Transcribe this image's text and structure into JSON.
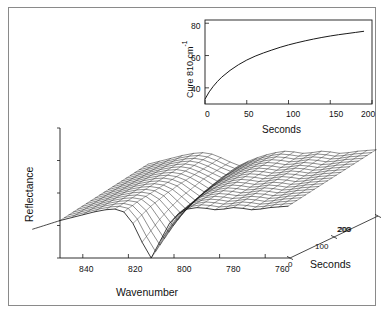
{
  "figure": {
    "title": "",
    "background_color": "#ffffff",
    "border_color": "#8a8a8a",
    "line_color": "#1a1a1a"
  },
  "main_plot": {
    "y_axis_label": "Reflectance",
    "x_axis_label": "Wavenumber",
    "depth_axis_label": "Seconds",
    "x_ticks": [
      "840",
      "820",
      "800",
      "780",
      "760"
    ],
    "depth_ticks": [
      "0",
      "100",
      "200"
    ],
    "depth_tick_overlap": "209",
    "y_tick_count": 5
  },
  "inset_plot": {
    "y_axis_label": "Cure 810 cm",
    "y_axis_label_sup": "-1",
    "x_axis_label": "Seconds",
    "y_ticks": [
      "80",
      "60",
      "40"
    ],
    "x_ticks": [
      "0",
      "50",
      "100",
      "150",
      "200"
    ]
  },
  "chart_data": [
    {
      "type": "line",
      "name": "inset-cure-kinetics",
      "title": "",
      "xlabel": "Seconds",
      "ylabel": "Cure 810 cm-1",
      "xlim": [
        0,
        200
      ],
      "ylim": [
        30,
        82
      ],
      "xticks": [
        0,
        50,
        100,
        150,
        200
      ],
      "yticks": [
        40,
        60,
        80
      ],
      "grid": false,
      "legend": "none",
      "x": [
        0,
        5,
        10,
        15,
        20,
        30,
        40,
        50,
        60,
        70,
        80,
        90,
        100,
        110,
        120,
        130,
        140,
        150,
        160,
        170,
        180,
        190
      ],
      "y": [
        33.0,
        37.5,
        41.0,
        44.0,
        46.6,
        50.8,
        54.3,
        57.2,
        59.6,
        61.6,
        63.4,
        65.1,
        66.6,
        67.9,
        69.1,
        70.2,
        71.2,
        72.1,
        72.9,
        73.6,
        74.3,
        75.0
      ]
    },
    {
      "type": "line",
      "name": "main-waterfall-surface",
      "title": "",
      "xlabel": "Wavenumber",
      "ylabel": "Reflectance",
      "zlabel": "Seconds",
      "xlim": [
        850,
        750
      ],
      "zlim": [
        0,
        200
      ],
      "grid": false,
      "legend": "none",
      "description": "3D waterfall mesh of reflectance spectra stacked over time; deep absorption valley near 810 cm-1 that fills in as cure proceeds",
      "trace_count": 21,
      "x": [
        850,
        845,
        840,
        835,
        830,
        826,
        822,
        818,
        814,
        810,
        806,
        802,
        798,
        794,
        790,
        786,
        782,
        778,
        774,
        770,
        766,
        762,
        758,
        754,
        750
      ],
      "series": [
        {
          "name": "t=0",
          "t": 0,
          "values": [
            0.52,
            0.56,
            0.6,
            0.64,
            0.67,
            0.68,
            0.64,
            0.48,
            0.22,
            0.0,
            0.24,
            0.48,
            0.62,
            0.68,
            0.7,
            0.69,
            0.67,
            0.68,
            0.7,
            0.69,
            0.67,
            0.68,
            0.7,
            0.71,
            0.72
          ]
        },
        {
          "name": "t=10",
          "t": 10,
          "values": [
            0.53,
            0.57,
            0.61,
            0.65,
            0.68,
            0.69,
            0.66,
            0.51,
            0.27,
            0.06,
            0.29,
            0.51,
            0.64,
            0.69,
            0.71,
            0.7,
            0.68,
            0.69,
            0.71,
            0.7,
            0.68,
            0.69,
            0.71,
            0.72,
            0.73
          ]
        },
        {
          "name": "t=20",
          "t": 20,
          "values": [
            0.54,
            0.58,
            0.62,
            0.66,
            0.69,
            0.7,
            0.67,
            0.54,
            0.32,
            0.12,
            0.34,
            0.54,
            0.65,
            0.7,
            0.72,
            0.71,
            0.69,
            0.7,
            0.72,
            0.71,
            0.69,
            0.7,
            0.72,
            0.73,
            0.74
          ]
        },
        {
          "name": "t=30",
          "t": 30,
          "values": [
            0.55,
            0.59,
            0.63,
            0.67,
            0.7,
            0.71,
            0.69,
            0.57,
            0.37,
            0.18,
            0.39,
            0.57,
            0.67,
            0.71,
            0.73,
            0.72,
            0.7,
            0.71,
            0.73,
            0.72,
            0.7,
            0.71,
            0.73,
            0.74,
            0.75
          ]
        },
        {
          "name": "t=40",
          "t": 40,
          "values": [
            0.56,
            0.6,
            0.64,
            0.68,
            0.71,
            0.72,
            0.7,
            0.6,
            0.42,
            0.24,
            0.43,
            0.6,
            0.68,
            0.72,
            0.74,
            0.73,
            0.71,
            0.72,
            0.74,
            0.73,
            0.71,
            0.72,
            0.74,
            0.75,
            0.76
          ]
        },
        {
          "name": "t=50",
          "t": 50,
          "values": [
            0.57,
            0.61,
            0.65,
            0.69,
            0.72,
            0.73,
            0.71,
            0.62,
            0.46,
            0.3,
            0.47,
            0.62,
            0.7,
            0.73,
            0.75,
            0.74,
            0.72,
            0.73,
            0.75,
            0.74,
            0.72,
            0.73,
            0.75,
            0.76,
            0.77
          ]
        },
        {
          "name": "t=60",
          "t": 60,
          "values": [
            0.58,
            0.62,
            0.66,
            0.7,
            0.73,
            0.74,
            0.72,
            0.64,
            0.5,
            0.35,
            0.51,
            0.64,
            0.71,
            0.74,
            0.76,
            0.75,
            0.73,
            0.74,
            0.76,
            0.75,
            0.73,
            0.74,
            0.76,
            0.77,
            0.78
          ]
        },
        {
          "name": "t=70",
          "t": 70,
          "values": [
            0.59,
            0.63,
            0.67,
            0.71,
            0.74,
            0.75,
            0.73,
            0.66,
            0.53,
            0.4,
            0.54,
            0.66,
            0.72,
            0.75,
            0.77,
            0.76,
            0.74,
            0.75,
            0.77,
            0.76,
            0.74,
            0.75,
            0.77,
            0.78,
            0.79
          ]
        },
        {
          "name": "t=80",
          "t": 80,
          "values": [
            0.6,
            0.64,
            0.68,
            0.72,
            0.75,
            0.76,
            0.74,
            0.68,
            0.56,
            0.44,
            0.57,
            0.68,
            0.73,
            0.76,
            0.78,
            0.77,
            0.75,
            0.76,
            0.78,
            0.77,
            0.75,
            0.76,
            0.78,
            0.79,
            0.8
          ]
        },
        {
          "name": "t=90",
          "t": 90,
          "values": [
            0.61,
            0.65,
            0.69,
            0.73,
            0.76,
            0.77,
            0.75,
            0.69,
            0.59,
            0.48,
            0.6,
            0.69,
            0.74,
            0.77,
            0.79,
            0.78,
            0.76,
            0.77,
            0.79,
            0.78,
            0.76,
            0.77,
            0.79,
            0.8,
            0.81
          ]
        },
        {
          "name": "t=100",
          "t": 100,
          "values": [
            0.62,
            0.66,
            0.7,
            0.74,
            0.77,
            0.78,
            0.76,
            0.71,
            0.61,
            0.51,
            0.62,
            0.71,
            0.75,
            0.78,
            0.8,
            0.79,
            0.77,
            0.78,
            0.8,
            0.79,
            0.77,
            0.78,
            0.8,
            0.81,
            0.82
          ]
        },
        {
          "name": "t=110",
          "t": 110,
          "values": [
            0.63,
            0.67,
            0.71,
            0.75,
            0.78,
            0.79,
            0.77,
            0.72,
            0.63,
            0.54,
            0.64,
            0.72,
            0.76,
            0.79,
            0.81,
            0.8,
            0.78,
            0.79,
            0.81,
            0.8,
            0.78,
            0.79,
            0.81,
            0.82,
            0.83
          ]
        },
        {
          "name": "t=120",
          "t": 120,
          "values": [
            0.64,
            0.68,
            0.72,
            0.76,
            0.79,
            0.8,
            0.78,
            0.73,
            0.65,
            0.57,
            0.66,
            0.73,
            0.77,
            0.8,
            0.82,
            0.81,
            0.79,
            0.8,
            0.82,
            0.81,
            0.79,
            0.8,
            0.82,
            0.83,
            0.84
          ]
        },
        {
          "name": "t=130",
          "t": 130,
          "values": [
            0.65,
            0.69,
            0.73,
            0.77,
            0.8,
            0.81,
            0.79,
            0.74,
            0.67,
            0.59,
            0.68,
            0.74,
            0.78,
            0.81,
            0.83,
            0.82,
            0.8,
            0.81,
            0.83,
            0.82,
            0.8,
            0.81,
            0.83,
            0.84,
            0.85
          ]
        },
        {
          "name": "t=140",
          "t": 140,
          "values": [
            0.66,
            0.7,
            0.74,
            0.78,
            0.81,
            0.82,
            0.8,
            0.75,
            0.69,
            0.61,
            0.69,
            0.75,
            0.79,
            0.82,
            0.84,
            0.83,
            0.81,
            0.82,
            0.84,
            0.83,
            0.81,
            0.82,
            0.84,
            0.85,
            0.86
          ]
        },
        {
          "name": "t=150",
          "t": 150,
          "values": [
            0.67,
            0.71,
            0.75,
            0.79,
            0.82,
            0.83,
            0.81,
            0.76,
            0.7,
            0.63,
            0.71,
            0.76,
            0.8,
            0.83,
            0.85,
            0.84,
            0.82,
            0.83,
            0.85,
            0.84,
            0.82,
            0.83,
            0.85,
            0.86,
            0.87
          ]
        },
        {
          "name": "t=160",
          "t": 160,
          "values": [
            0.68,
            0.72,
            0.76,
            0.8,
            0.83,
            0.84,
            0.82,
            0.77,
            0.71,
            0.65,
            0.72,
            0.77,
            0.81,
            0.84,
            0.86,
            0.85,
            0.83,
            0.84,
            0.86,
            0.85,
            0.83,
            0.84,
            0.86,
            0.87,
            0.88
          ]
        },
        {
          "name": "t=170",
          "t": 170,
          "values": [
            0.69,
            0.73,
            0.77,
            0.81,
            0.84,
            0.85,
            0.83,
            0.78,
            0.72,
            0.66,
            0.73,
            0.78,
            0.82,
            0.85,
            0.87,
            0.86,
            0.84,
            0.85,
            0.87,
            0.86,
            0.84,
            0.85,
            0.87,
            0.88,
            0.89
          ]
        },
        {
          "name": "t=180",
          "t": 180,
          "values": [
            0.7,
            0.74,
            0.78,
            0.82,
            0.85,
            0.86,
            0.84,
            0.79,
            0.73,
            0.68,
            0.74,
            0.79,
            0.83,
            0.86,
            0.88,
            0.87,
            0.85,
            0.86,
            0.88,
            0.87,
            0.85,
            0.86,
            0.88,
            0.89,
            0.9
          ]
        },
        {
          "name": "t=190",
          "t": 190,
          "values": [
            0.71,
            0.75,
            0.79,
            0.83,
            0.86,
            0.87,
            0.85,
            0.8,
            0.74,
            0.69,
            0.75,
            0.8,
            0.84,
            0.87,
            0.89,
            0.88,
            0.86,
            0.87,
            0.89,
            0.88,
            0.86,
            0.87,
            0.89,
            0.9,
            0.91
          ]
        },
        {
          "name": "t=200",
          "t": 200,
          "values": [
            0.72,
            0.76,
            0.8,
            0.84,
            0.87,
            0.88,
            0.86,
            0.81,
            0.75,
            0.7,
            0.76,
            0.81,
            0.85,
            0.88,
            0.9,
            0.89,
            0.87,
            0.88,
            0.9,
            0.89,
            0.87,
            0.88,
            0.9,
            0.91,
            0.92
          ]
        }
      ]
    }
  ]
}
